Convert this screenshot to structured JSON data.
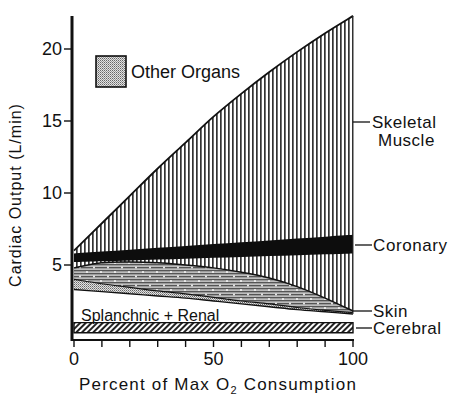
{
  "chart_data": {
    "type": "area",
    "title": "",
    "xlabel": "Percent of Max O₂ Consumption",
    "xlabel_parts": {
      "pre": "Percent of Max O",
      "sub": "2",
      "post": " Consumption"
    },
    "ylabel": "Cardiac Output (L/min)",
    "xlim": [
      0,
      100
    ],
    "ylim": [
      0,
      22.5
    ],
    "x_ticks": [
      0,
      10,
      20,
      30,
      40,
      50,
      60,
      70,
      80,
      90,
      100
    ],
    "x_tick_labels": [
      {
        "x": 0,
        "label": "0"
      },
      {
        "x": 50,
        "label": "50"
      },
      {
        "x": 100,
        "label": "100"
      }
    ],
    "y_ticks": [
      {
        "y": 5,
        "label": "5"
      },
      {
        "y": 10,
        "label": "10"
      },
      {
        "y": 15,
        "label": "15"
      },
      {
        "y": 20,
        "label": "20"
      }
    ],
    "grid": false,
    "stacked": true,
    "x": [
      0,
      10,
      20,
      30,
      40,
      50,
      60,
      70,
      80,
      90,
      100
    ],
    "boundaries": {
      "cerebral_bottom": [
        0.3,
        0.3,
        0.3,
        0.3,
        0.3,
        0.3,
        0.3,
        0.3,
        0.3,
        0.3,
        0.3
      ],
      "cerebral_top": [
        1.0,
        1.0,
        1.0,
        1.0,
        1.0,
        1.0,
        1.0,
        1.0,
        1.0,
        1.0,
        1.0
      ],
      "splanchnic_top": [
        3.3,
        3.15,
        3.0,
        2.85,
        2.7,
        2.5,
        2.3,
        2.1,
        1.9,
        1.75,
        1.6
      ],
      "other_top": [
        4.0,
        3.7,
        3.45,
        3.2,
        3.0,
        2.75,
        2.5,
        2.3,
        2.05,
        1.85,
        1.7
      ],
      "skin_top": [
        4.8,
        5.15,
        5.2,
        5.15,
        5.0,
        4.8,
        4.5,
        4.1,
        3.5,
        2.7,
        1.8
      ],
      "coronary_bottom": [
        5.2,
        5.26,
        5.32,
        5.38,
        5.44,
        5.5,
        5.56,
        5.62,
        5.68,
        5.74,
        5.8
      ],
      "coronary_top": [
        5.8,
        5.93,
        6.06,
        6.19,
        6.32,
        6.45,
        6.58,
        6.71,
        6.84,
        6.97,
        7.1
      ],
      "muscle_top": [
        6.0,
        7.9,
        9.8,
        11.7,
        13.5,
        15.3,
        16.9,
        18.4,
        19.8,
        21.1,
        22.3
      ]
    },
    "series": [
      {
        "name": "Cerebral",
        "pattern": "diagonal-hatch",
        "values": [
          0.7,
          0.7,
          0.7,
          0.7,
          0.7,
          0.7,
          0.7,
          0.7,
          0.7,
          0.7,
          0.7
        ]
      },
      {
        "name": "Splanchnic + Renal",
        "pattern": "blank",
        "values": [
          2.3,
          2.15,
          2.0,
          1.85,
          1.7,
          1.5,
          1.3,
          1.1,
          0.9,
          0.75,
          0.6
        ]
      },
      {
        "name": "Other Organs",
        "pattern": "stipple",
        "values": [
          0.7,
          0.55,
          0.45,
          0.35,
          0.3,
          0.25,
          0.2,
          0.2,
          0.15,
          0.1,
          0.1
        ]
      },
      {
        "name": "Skin",
        "pattern": "horizontal-lines-dots",
        "values": [
          0.8,
          1.45,
          1.75,
          1.95,
          2.0,
          2.05,
          2.0,
          1.8,
          1.45,
          0.85,
          0.1
        ]
      },
      {
        "name": "Coronary",
        "pattern": "solid-black",
        "values": [
          0.6,
          0.67,
          0.74,
          0.81,
          0.88,
          0.95,
          1.02,
          1.09,
          1.16,
          1.23,
          1.3
        ]
      },
      {
        "name": "Skeletal Muscle",
        "pattern": "vertical-lines",
        "values": [
          0.6,
          2.5,
          4.3,
          6.0,
          7.3,
          8.6,
          9.8,
          11.0,
          12.2,
          13.5,
          14.8
        ]
      }
    ],
    "legend": {
      "entries": [
        {
          "label": "Other Organs",
          "pattern": "stipple"
        }
      ],
      "position": "upper-left"
    },
    "annotations": [
      {
        "text": "Skeletal",
        "text2": "Muscle",
        "pointer_y": 12.5
      },
      {
        "text": "Coronary",
        "pointer_y": 6.5
      },
      {
        "text": "Skin",
        "pointer_y": 1.7
      },
      {
        "text": "Cerebral",
        "pointer_y": 0.65
      },
      {
        "text": "Splanchnic + Renal",
        "inside": true
      }
    ]
  },
  "colors": {
    "ink": "#111111",
    "background": "#ffffff",
    "stipple_bg": "#d8d8d8"
  }
}
